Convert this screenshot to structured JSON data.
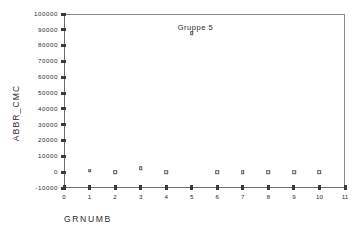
{
  "chart_data": {
    "type": "scatter",
    "title": "",
    "xlabel": "GRNUMB",
    "ylabel": "ABBR_CMC",
    "xlim": [
      0,
      11
    ],
    "ylim": [
      -10000,
      100000
    ],
    "grid": false,
    "legend": null,
    "marker_style": "open-square",
    "x": [
      1,
      2,
      3,
      4,
      5,
      6,
      7,
      8,
      9,
      10
    ],
    "values": [
      900,
      0,
      2500,
      0,
      88000,
      0,
      0,
      0,
      0,
      0
    ],
    "series": [
      {
        "name": "ABBR_CMC",
        "x": [
          1,
          2,
          3,
          4,
          5,
          6,
          7,
          8,
          9,
          10
        ],
        "values": [
          900,
          0,
          2500,
          0,
          88000,
          0,
          0,
          0,
          0,
          0
        ]
      }
    ],
    "xticks": [
      0,
      1,
      2,
      3,
      4,
      5,
      6,
      7,
      8,
      9,
      10,
      11
    ],
    "xticklabels": [
      "0",
      "1",
      "2",
      "3",
      "4",
      "5",
      "6",
      "7",
      "8",
      "9",
      "10",
      "11"
    ],
    "yticks": [
      -10000,
      0,
      10000,
      20000,
      30000,
      40000,
      50000,
      60000,
      70000,
      80000,
      90000,
      100000
    ],
    "yticklabels": [
      "-10000",
      "0",
      "10000",
      "20000",
      "30000",
      "40000",
      "50000",
      "60000",
      "70000",
      "80000",
      "90000",
      "100000"
    ],
    "annotations": [
      {
        "text": "Gruppe 5",
        "x": 4.45,
        "y": 91000
      }
    ]
  },
  "colors": {
    "frame": "#8a8a8a",
    "axis": "#6d6d6d",
    "tick": "#3a3a3a",
    "text": "#2b2b2b",
    "marker_edge": "#555555",
    "marker_fill": "#ffffff",
    "background": "#ffffff"
  }
}
